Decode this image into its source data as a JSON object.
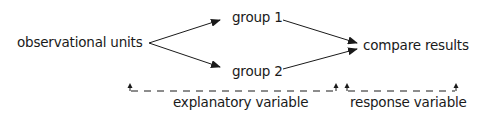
{
  "diagram": {
    "nodes": {
      "source": "observational units",
      "group1": "group 1",
      "group2": "group 2",
      "target": "compare results"
    },
    "variables": {
      "explanatory": "explanatory variable",
      "response": "response variable"
    },
    "edges": [
      {
        "from": "observational units",
        "to": "group 1"
      },
      {
        "from": "observational units",
        "to": "group 2"
      },
      {
        "from": "group 1",
        "to": "compare results"
      },
      {
        "from": "group 2",
        "to": "compare results"
      }
    ],
    "colors": {
      "ink": "#1a1a1a",
      "background": "#ffffff"
    }
  }
}
